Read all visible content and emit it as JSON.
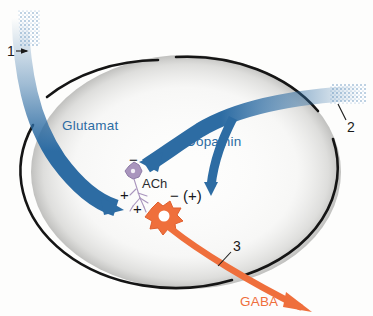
{
  "figure": {
    "background_color": "#fdfdfc"
  },
  "colors": {
    "glutamate_blue": "#2d6ca3",
    "dopamine_blue": "#2d6ca3",
    "gaba_orange": "#ef6f3c",
    "ach_purple": "#a995bd",
    "outline_black": "#151515",
    "stipple_gray": "#cfcfcf",
    "label_blue": "#2d6ca3",
    "label_orange": "#ef6f3c",
    "label_black": "#1a1a1a"
  },
  "structure": {
    "outer_boundary_name": "striatum-outline",
    "outer_boundary_shape": "ellipse"
  },
  "pathways": [
    {
      "id": "glutamate",
      "label": "Glutamat",
      "color": "#2d6ca3",
      "callout": "1",
      "origin": "upper-left",
      "target": "gaba-neuron",
      "sign": "+",
      "label_x": 62,
      "label_y": 126
    },
    {
      "id": "dopamine",
      "label": "Dopamin",
      "color": "#2d6ca3",
      "callout": "2",
      "origin": "right",
      "target": "ach-interneuron",
      "sign": "-",
      "label_x": 186,
      "label_y": 142
    },
    {
      "id": "gaba",
      "label": "GABA",
      "color": "#ef6f3c",
      "callout": "3",
      "origin": "gaba-neuron",
      "target": "lower-right-outside",
      "label_x": 240,
      "label_y": 302
    }
  ],
  "neurons": [
    {
      "id": "ach-interneuron",
      "label": "ACh",
      "color": "#a995bd",
      "label_x": 142,
      "label_y": 185
    },
    {
      "id": "gaba-neuron",
      "label": "",
      "color": "#ef6f3c"
    }
  ],
  "callouts": [
    {
      "num": "1",
      "x": 7,
      "y": 52,
      "name": "callout-1"
    },
    {
      "num": "2",
      "x": 347,
      "y": 128,
      "name": "callout-2"
    },
    {
      "num": "3",
      "x": 233,
      "y": 247,
      "name": "callout-3"
    }
  ],
  "signs": [
    {
      "text": "−",
      "x": 129,
      "y": 161,
      "name": "sign-minus-dopamine-ach"
    },
    {
      "text": "+",
      "x": 120,
      "y": 196,
      "name": "sign-plus-glutamate"
    },
    {
      "text": "+",
      "x": 133,
      "y": 210,
      "name": "sign-plus-ach-gaba"
    },
    {
      "text": "− (+)",
      "x": 170,
      "y": 197,
      "name": "sign-minus-plus-dopamine-gaba"
    }
  ]
}
